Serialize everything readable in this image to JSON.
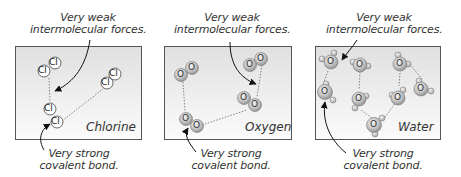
{
  "panels": [
    {
      "name": "Chlorine",
      "label": "Chlorine",
      "atom_symbol": "Cl",
      "top_caption": [
        "Very weak",
        "intermolecular forces."
      ],
      "bottom_caption": [
        "Very strong",
        "covalent bond."
      ]
    },
    {
      "name": "Oxygen",
      "label": "Oxygen",
      "atom_symbol": "O",
      "top_caption": [
        "Very weak",
        "intermolecular forces."
      ],
      "bottom_caption": [
        "Very strong",
        "covalent bond."
      ]
    },
    {
      "name": "Water",
      "label": "Water",
      "atom_symbol": "O",
      "top_caption": [
        "Very weak",
        "intermolecular forces."
      ],
      "bottom_caption": [
        "Very strong",
        "covalent bond."
      ]
    }
  ],
  "colors": {
    "box_border": "#555555",
    "box_fill_top": "#e2e2e2",
    "box_fill_bottom": "#fafafa",
    "atom_fill": "#bdbdbd",
    "text": "#333333"
  }
}
